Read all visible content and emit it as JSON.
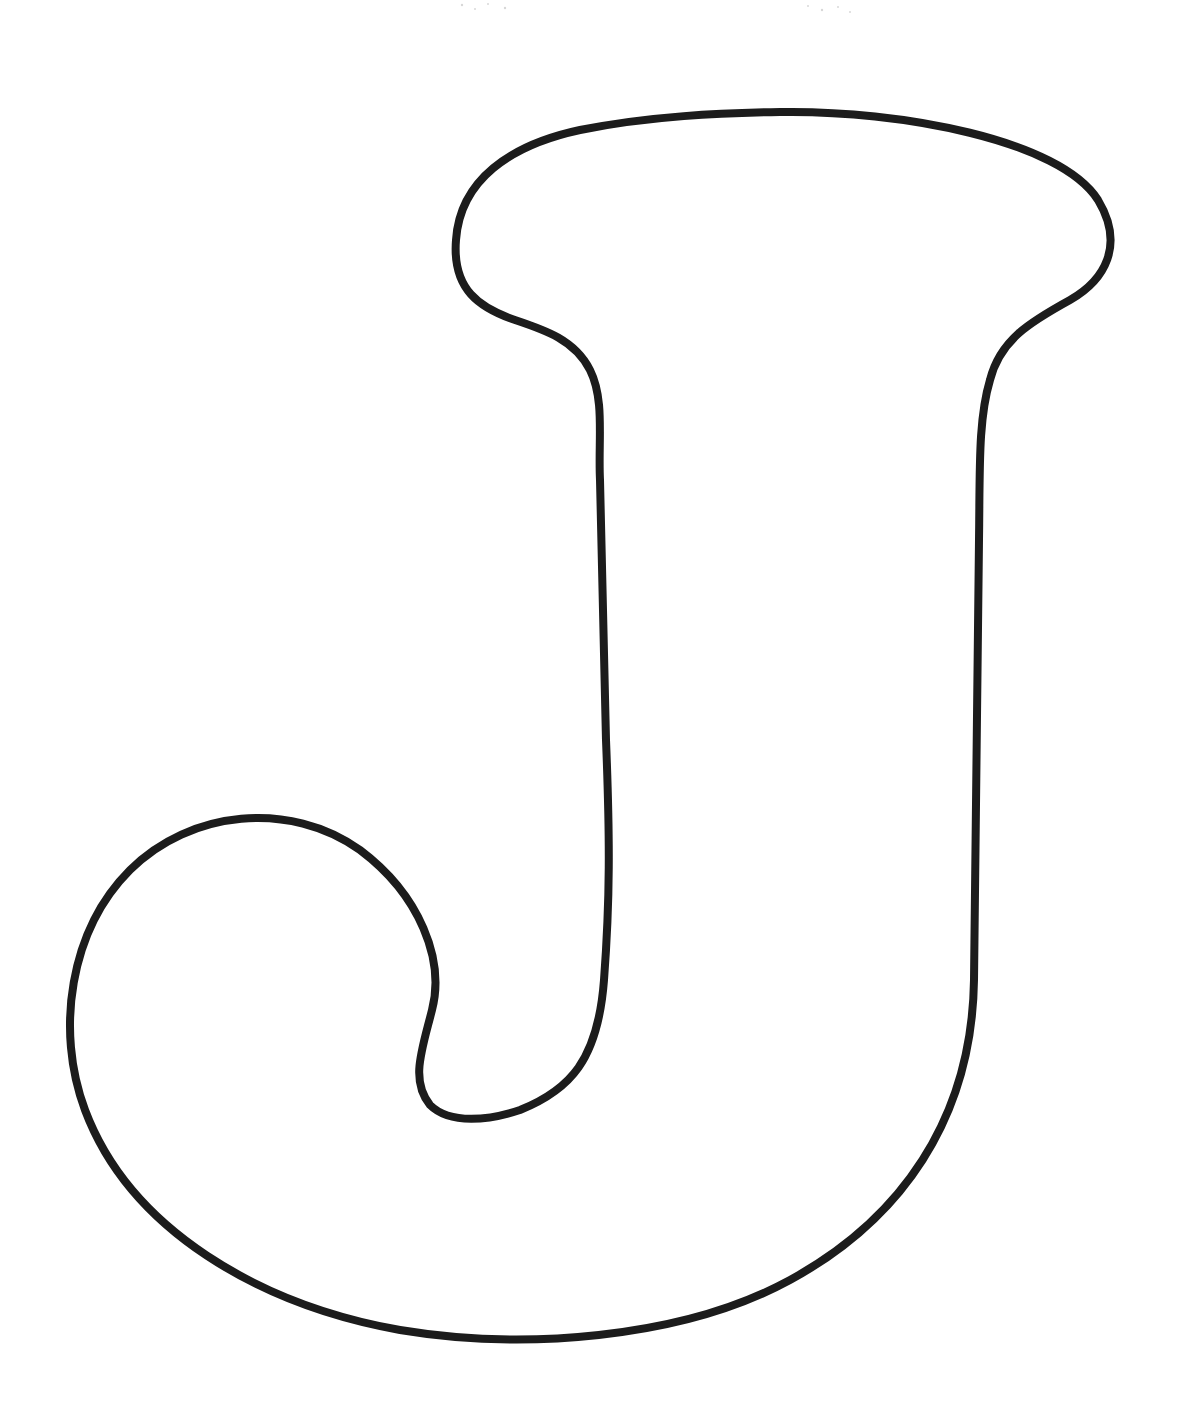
{
  "page": {
    "letter": "J"
  },
  "colors": {
    "background": "#ffffff",
    "outline": "#1c1c1c"
  },
  "outline": {
    "stroke_width": 8
  }
}
